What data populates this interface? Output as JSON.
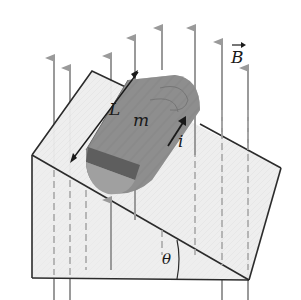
{
  "diagram": {
    "labels": {
      "length": "L",
      "mass": "m",
      "current": "i",
      "field": "B",
      "angle": "θ"
    },
    "elements": {
      "wedge": "inclined plane (wooden wedge)",
      "rod": "wooden log / rod of mass m and length L",
      "field_lines": "uniform vertical magnetic field B (gray upward arrows)",
      "current_arrow": "current i along the rod",
      "length_arrow": "double-headed arrow indicating length L",
      "angle_arc": "incline angle θ"
    },
    "colors": {
      "outline": "#2b2b2b",
      "field_arrow": "#9a9a9a",
      "wedge_fill": "#ececec",
      "log_fill": "#8c8c8c",
      "log_band": "#5e5e5e",
      "log_end": "#a3a3a3"
    }
  }
}
